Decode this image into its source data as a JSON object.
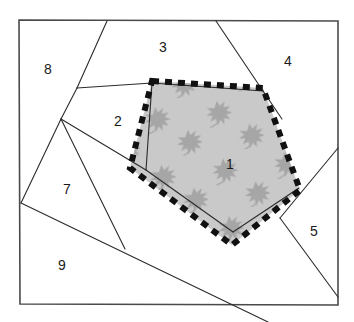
{
  "figure": {
    "canvas": {
      "width": 354,
      "height": 322,
      "background": "#ffffff"
    },
    "frame": {
      "name": "outer-rectangle",
      "points": "19,20 338,21 338,305 20,304",
      "stroke": "#4a4a4a",
      "stroke_width": 1.6,
      "fill": "#ffffff"
    },
    "highlight_polygon": {
      "name": "shaded-pentagon",
      "points": "152,81 263,88 300,190 232,245 130,168",
      "fill": "#c9c9c9",
      "stroke": "#111111",
      "stroke_width": 6,
      "stroke_dasharray": "7 6",
      "stroke_linecap": "butt"
    },
    "pattern": {
      "name": "leaf-motif",
      "color": "#a8a8a8",
      "description": "scattered maple-leaf motifs filling the shaded pentagon"
    },
    "partition_lines": [
      {
        "name": "line-top-diagonal",
        "x1": 107,
        "y1": 21,
        "x2": 77,
        "y2": 88
      },
      {
        "name": "line-upper-left-lower",
        "x1": 77,
        "y1": 88,
        "x2": 61,
        "y2": 119
      },
      {
        "name": "line-left-to-border",
        "x1": 61,
        "y1": 119,
        "x2": 21,
        "y2": 203
      },
      {
        "name": "line-horizontal-to-pentagon",
        "x1": 77,
        "y1": 88,
        "x2": 152,
        "y2": 83
      },
      {
        "name": "line-pentagon-top-edge",
        "x1": 152,
        "y1": 83,
        "x2": 263,
        "y2": 91
      },
      {
        "name": "line-pentagon-left-inner",
        "x1": 152,
        "y1": 83,
        "x2": 146,
        "y2": 170
      },
      {
        "name": "line-junction-to-pentagon-left",
        "x1": 61,
        "y1": 119,
        "x2": 146,
        "y2": 170
      },
      {
        "name": "line-pentagon-bottom-inner",
        "x1": 146,
        "y1": 170,
        "x2": 233,
        "y2": 232
      },
      {
        "name": "line-pentagon-right-inner",
        "x1": 233,
        "y1": 232,
        "x2": 299,
        "y2": 188
      },
      {
        "name": "line-junction-down-right",
        "x1": 61,
        "y1": 119,
        "x2": 125,
        "y2": 249
      },
      {
        "name": "line-long-diagonal",
        "x1": 21,
        "y1": 203,
        "x2": 268,
        "y2": 322
      },
      {
        "name": "line-right-upper-diagonal",
        "x1": 216,
        "y1": 21,
        "x2": 263,
        "y2": 91
      },
      {
        "name": "line-right-from-pentagon",
        "x1": 263,
        "y1": 91,
        "x2": 282,
        "y2": 119
      },
      {
        "name": "line-right-border-diagonal",
        "x1": 338,
        "y1": 148,
        "x2": 280,
        "y2": 218
      },
      {
        "name": "line-right-lower-diagonal",
        "x1": 280,
        "y1": 218,
        "x2": 338,
        "y2": 297
      }
    ],
    "region_labels": [
      {
        "id": "1",
        "text": "1",
        "x": 230,
        "y": 165
      },
      {
        "id": "2",
        "text": "2",
        "x": 118,
        "y": 122
      },
      {
        "id": "3",
        "text": "3",
        "x": 163,
        "y": 48
      },
      {
        "id": "4",
        "text": "4",
        "x": 288,
        "y": 62
      },
      {
        "id": "5",
        "text": "5",
        "x": 314,
        "y": 232
      },
      {
        "id": "7",
        "text": "7",
        "x": 67,
        "y": 190
      },
      {
        "id": "8",
        "text": "8",
        "x": 48,
        "y": 70
      },
      {
        "id": "9",
        "text": "9",
        "x": 62,
        "y": 266
      }
    ]
  }
}
